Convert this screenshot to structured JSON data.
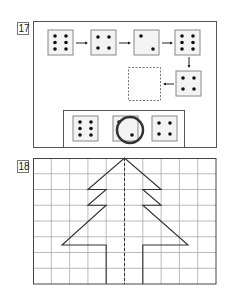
{
  "colors": {
    "frame": "#555555",
    "die_fill": "#f3f3f3",
    "die_border": "#888888",
    "pip": "#111111",
    "arrow": "#222222",
    "grid": "#aaaaaa",
    "tree": "#333333",
    "circle": "#333333"
  },
  "exercise_17": {
    "label": "17",
    "sequence": [
      {
        "pips": 6
      },
      {
        "pips": 4
      },
      {
        "pips": 2
      },
      {
        "pips": 6
      },
      {
        "pips": 4
      },
      {
        "pips": null,
        "placeholder": "dashed-empty-box"
      }
    ],
    "answer_options": [
      {
        "pips": 6,
        "selected": false
      },
      {
        "pips": 2,
        "selected": true
      },
      {
        "pips": 4,
        "selected": false
      }
    ]
  },
  "exercise_18": {
    "label": "18",
    "grid": {
      "columns": 10,
      "rows": 8
    },
    "figure": "half fir tree with dashed symmetry axis"
  }
}
